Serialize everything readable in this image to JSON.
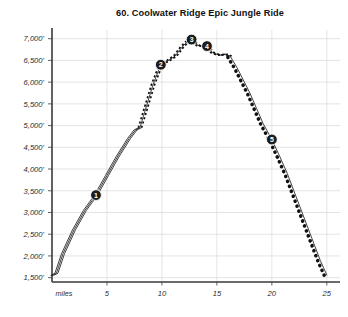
{
  "title": "60. Coolwater Ridge Epic Jungle Ride",
  "axis": {
    "x_name": "miles",
    "x_ticks": [
      "5",
      "10",
      "15",
      "20",
      "25"
    ],
    "y_ticks": [
      "7,000'",
      "6,500'",
      "6,000'",
      "5,500'",
      "5,000'",
      "4,500'",
      "4,000'",
      "3,500'",
      "3,000'",
      "2,500'",
      "2,000'",
      "1,500'"
    ]
  },
  "markers": [
    {
      "label": "1",
      "mile": 4.0,
      "elev": 3400
    },
    {
      "label": "2",
      "mile": 9.9,
      "elev": 6400
    },
    {
      "label": "3",
      "mile": 12.7,
      "elev": 6980
    },
    {
      "label": "4",
      "mile": 14.1,
      "elev": 6830
    },
    {
      "label": "5",
      "mile": 20.0,
      "elev": 4680
    }
  ],
  "colors": {
    "axis": "#3a3a3a",
    "grid": "#d9d9d9",
    "route": "#111111",
    "marker_fill": "#1c1c1c",
    "marker_text": "#ffffff",
    "background": "#ffffff"
  },
  "chart_data": {
    "type": "line",
    "title": "60. Coolwater Ridge Epic Jungle Ride",
    "xlabel": "miles",
    "ylabel": "elevation (feet)",
    "xlim": [
      0,
      26.2
    ],
    "ylim": [
      1400,
      7200
    ],
    "grid": true,
    "legend": false,
    "x_tick_values": [
      5,
      10,
      15,
      20,
      25
    ],
    "y_tick_values": [
      7000,
      6500,
      6000,
      5500,
      5000,
      4500,
      4000,
      3500,
      3000,
      2500,
      2000,
      1500
    ],
    "series": [
      {
        "name": "elevation profile",
        "x": [
          0.0,
          0.4,
          1.0,
          2.0,
          3.0,
          4.0,
          5.0,
          6.0,
          7.0,
          7.6,
          8.0,
          8.6,
          9.2,
          9.9,
          10.6,
          11.2,
          11.8,
          12.3,
          12.7,
          13.0,
          13.3,
          13.7,
          14.1,
          14.6,
          15.2,
          15.8,
          16.2,
          16.8,
          17.4,
          18.0,
          18.6,
          19.2,
          20.0,
          20.7,
          21.4,
          22.0,
          22.6,
          23.2,
          23.8,
          24.4,
          25.0
        ],
        "y": [
          1550,
          1600,
          2050,
          2600,
          3050,
          3400,
          3850,
          4300,
          4700,
          4900,
          4950,
          5450,
          5950,
          6400,
          6500,
          6600,
          6800,
          6930,
          6980,
          6900,
          6840,
          6830,
          6830,
          6680,
          6620,
          6640,
          6600,
          6350,
          6050,
          5750,
          5400,
          5050,
          4680,
          4300,
          3900,
          3500,
          3100,
          2700,
          2300,
          1900,
          1560
        ],
        "style_segments": [
          {
            "from_mile": 0.0,
            "to_mile": 8.0,
            "style": "solid-double"
          },
          {
            "from_mile": 8.0,
            "to_mile": 16.2,
            "style": "dashed"
          },
          {
            "from_mile": 16.2,
            "to_mile": 25.0,
            "style": "dotted-large"
          }
        ]
      }
    ]
  }
}
